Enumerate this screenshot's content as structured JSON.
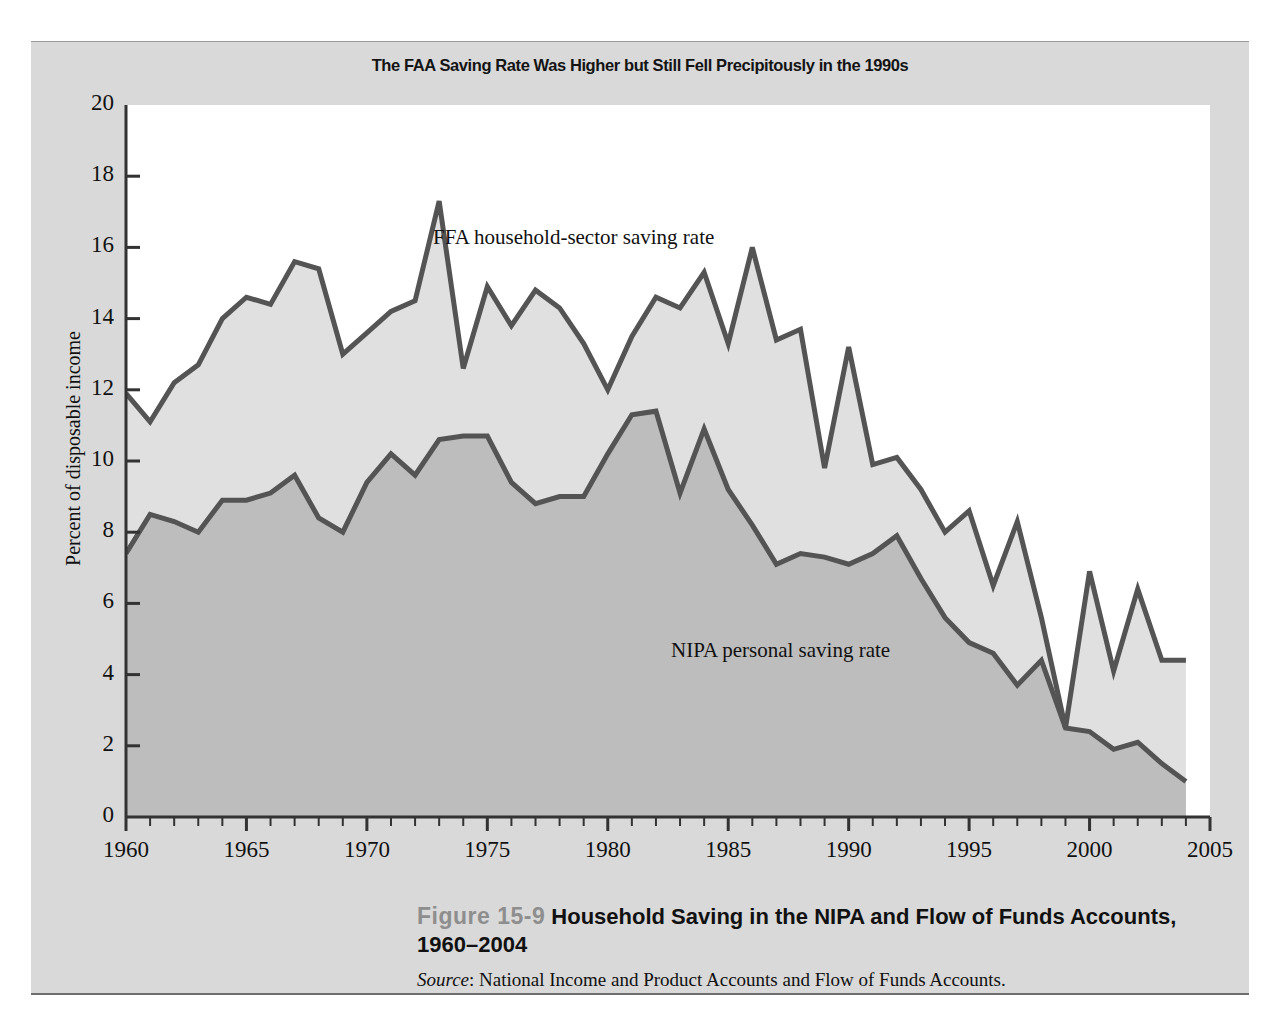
{
  "figure": {
    "chart_title": "The FAA Saving Rate Was Higher but Still Fell Precipitously in the 1990s",
    "figure_number": "Figure 15-9",
    "caption_title": "Household Saving in the NIPA and Flow of Funds Accounts, 1960–2004",
    "source_word": "Source",
    "source_text": ": National Income and Product Accounts and Flow of Funds Accounts.",
    "colors": {
      "panel_background": "#d9d9d9",
      "plot_background": "#ffffff",
      "ffa_band_fill": "#e0e0e0",
      "nipa_band_fill": "#bdbdbd",
      "line_stroke": "#545454",
      "axis_stroke": "#333333",
      "figure_number_color": "#8e8e8e"
    }
  },
  "chart_data": {
    "type": "area",
    "title": "The FAA Saving Rate Was Higher but Still Fell Precipitously in the 1990s",
    "xlabel": "",
    "ylabel": "Percent of disposable income",
    "xlim": [
      1960,
      2005
    ],
    "ylim": [
      0,
      20
    ],
    "ytick_step": 2,
    "xtick_step": 5,
    "minor_xtick_step": 1,
    "grid": false,
    "legend": "inline-annotations",
    "yticks": [
      0,
      2,
      4,
      6,
      8,
      10,
      12,
      14,
      16,
      18,
      20
    ],
    "xticks": [
      1960,
      1965,
      1970,
      1975,
      1980,
      1985,
      1990,
      1995,
      2000,
      2005
    ],
    "x": [
      1960,
      1961,
      1962,
      1963,
      1964,
      1965,
      1966,
      1967,
      1968,
      1969,
      1970,
      1971,
      1972,
      1973,
      1974,
      1975,
      1976,
      1977,
      1978,
      1979,
      1980,
      1981,
      1982,
      1983,
      1984,
      1985,
      1986,
      1987,
      1988,
      1989,
      1990,
      1991,
      1992,
      1993,
      1994,
      1995,
      1996,
      1997,
      1998,
      1999,
      2000,
      2001,
      2002,
      2003,
      2004
    ],
    "series": [
      {
        "name": "FFA household-sector saving rate",
        "annotation": "FFA household-sector saving rate",
        "fill": "#e0e0e0",
        "values": [
          11.9,
          11.1,
          12.2,
          12.7,
          14.0,
          14.6,
          14.4,
          15.6,
          15.4,
          13.0,
          13.6,
          14.2,
          14.5,
          17.3,
          12.6,
          14.9,
          13.8,
          14.8,
          14.3,
          13.3,
          12.0,
          13.5,
          14.6,
          14.3,
          15.3,
          13.3,
          16.0,
          13.4,
          13.7,
          9.8,
          13.2,
          9.9,
          10.1,
          9.2,
          8.0,
          8.6,
          6.5,
          8.3,
          5.6,
          2.5,
          6.9,
          4.1,
          6.4,
          4.4,
          4.4
        ]
      },
      {
        "name": "NIPA personal saving rate",
        "annotation": "NIPA personal saving rate",
        "fill": "#bdbdbd",
        "values": [
          7.4,
          8.5,
          8.3,
          8.0,
          8.9,
          8.9,
          9.1,
          9.6,
          8.4,
          8.0,
          9.4,
          10.2,
          9.6,
          10.6,
          10.7,
          10.7,
          9.4,
          8.8,
          9.0,
          9.0,
          10.2,
          11.3,
          11.4,
          9.1,
          10.9,
          9.2,
          8.2,
          7.1,
          7.4,
          7.3,
          7.1,
          7.4,
          7.9,
          6.7,
          5.6,
          4.9,
          4.6,
          3.7,
          4.4,
          2.5,
          2.4,
          1.9,
          2.1,
          1.5,
          1.0
        ]
      }
    ]
  },
  "axis": {
    "y_label": "Percent of disposable income",
    "y_tick_labels": [
      "20",
      "18",
      "16",
      "14",
      "12",
      "10",
      "8",
      "6",
      "4",
      "2",
      "0"
    ],
    "x_tick_labels": [
      "1960",
      "1965",
      "1970",
      "1975",
      "1980",
      "1985",
      "1990",
      "1995",
      "2000",
      "2005"
    ]
  }
}
